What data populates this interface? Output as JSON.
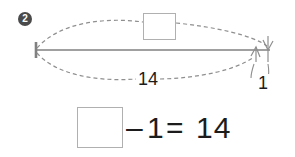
{
  "problem": {
    "number": "2"
  },
  "diagram": {
    "type": "number-line-jump",
    "line": {
      "x_start": 36,
      "x_end": 270,
      "y": 50,
      "color": "#808080"
    },
    "left_tick": {
      "x": 36,
      "y_top": 42,
      "y_bottom": 58
    },
    "top_arc": {
      "style": "dashed",
      "from_x": 36,
      "to_x": 268,
      "peak_y": 22,
      "arrow_at": "right",
      "label_box": "empty"
    },
    "bottom_arc": {
      "style": "dashed",
      "from_x": 36,
      "to_x": 256,
      "dip_y": 79,
      "arrow_at": "right",
      "label": "14"
    },
    "small_arrow_label": "1",
    "boxes": [
      {
        "name": "top-answer-box",
        "value": ""
      }
    ]
  },
  "equation": {
    "box_value": "",
    "minus": "–",
    "operand": "1",
    "equals": "=",
    "result": "14",
    "full_text": "□ – 1 = 14"
  },
  "colors": {
    "ink": "#1c1c1c",
    "line": "#808080",
    "dash": "#909090",
    "box_border": "#b0b0b0",
    "badge_fill": "#4a4a4a",
    "background": "#ffffff"
  }
}
